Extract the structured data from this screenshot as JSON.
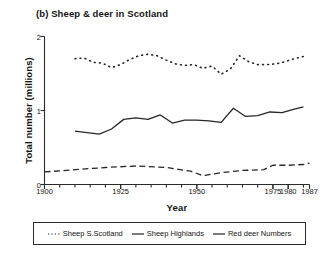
{
  "chart_data": {
    "type": "line",
    "title": "(b) Sheep & deer in Scotland",
    "xlabel": "Year",
    "ylabel": "Total number (millions)",
    "xlim": [
      1900,
      1987
    ],
    "ylim": [
      0,
      2
    ],
    "xticks": [
      1900,
      1925,
      1950,
      1975,
      1980,
      1987
    ],
    "xtick_labels": [
      "1900",
      "1925",
      "1950",
      "1975",
      "1980",
      "1987"
    ],
    "yticks": [
      0,
      1,
      2
    ],
    "ytick_labels": [
      "0",
      "1",
      "2"
    ],
    "minor_xtick_interval": 5,
    "grid": false,
    "legend_position": "below",
    "series": [
      {
        "name": "Sheep S.Scotland",
        "style": "dotted",
        "color": "#262626",
        "x": [
          1910,
          1913,
          1916,
          1919,
          1922,
          1925,
          1928,
          1931,
          1934,
          1937,
          1940,
          1943,
          1946,
          1949,
          1952,
          1955,
          1958,
          1961,
          1964,
          1967,
          1970,
          1973,
          1976,
          1979,
          1982,
          1985
        ],
        "values": [
          1.7,
          1.71,
          1.65,
          1.64,
          1.58,
          1.62,
          1.69,
          1.74,
          1.76,
          1.74,
          1.68,
          1.63,
          1.61,
          1.62,
          1.57,
          1.6,
          1.49,
          1.56,
          1.74,
          1.66,
          1.62,
          1.62,
          1.63,
          1.66,
          1.7,
          1.73
        ]
      },
      {
        "name": "Sheep Highlands",
        "style": "solid",
        "color": "#262626",
        "x": [
          1910,
          1914,
          1918,
          1922,
          1926,
          1930,
          1934,
          1938,
          1942,
          1946,
          1950,
          1954,
          1958,
          1962,
          1966,
          1970,
          1974,
          1978,
          1982,
          1985
        ],
        "values": [
          0.72,
          0.7,
          0.68,
          0.75,
          0.88,
          0.9,
          0.88,
          0.94,
          0.83,
          0.87,
          0.87,
          0.86,
          0.84,
          1.03,
          0.92,
          0.93,
          0.98,
          0.97,
          1.02,
          1.05
        ]
      },
      {
        "name": "Red deer Numbers",
        "style": "dashed",
        "color": "#262626",
        "x": [
          1900,
          1910,
          1920,
          1930,
          1940,
          1948,
          1952,
          1958,
          1965,
          1972,
          1975,
          1980,
          1985,
          1987
        ],
        "values": [
          0.17,
          0.2,
          0.23,
          0.25,
          0.23,
          0.18,
          0.12,
          0.16,
          0.19,
          0.2,
          0.26,
          0.26,
          0.27,
          0.29
        ]
      }
    ]
  },
  "legend": {
    "items": [
      {
        "label": "Sheep S.Scotland",
        "style": "dotted"
      },
      {
        "label": "Sheep Highlands",
        "style": "solid"
      },
      {
        "label": "Red deer Numbers",
        "style": "dashed"
      }
    ]
  }
}
